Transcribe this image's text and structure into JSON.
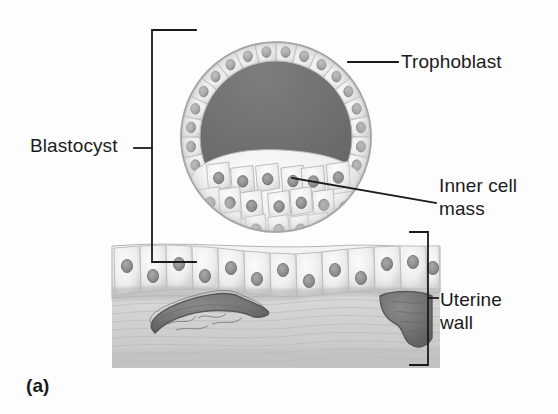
{
  "figure": {
    "panel_label": "(a)",
    "background_color": "#fdfdfd",
    "line_color": "#1b1b1b",
    "width": 558,
    "height": 414
  },
  "labels": {
    "blastocyst": "Blastocyst",
    "trophoblast": "Trophoblast",
    "inner_cell_mass_line1": "Inner cell",
    "inner_cell_mass_line2": "mass",
    "uterine_wall_line1": "Uterine",
    "uterine_wall_line2": "wall"
  },
  "structures": {
    "blastocyst": {
      "name": "blastocyst",
      "shape": "sphere",
      "center_x": 276,
      "center_y": 137,
      "radius": 96,
      "bracket": {
        "x": 152,
        "y_top": 30,
        "y_bottom": 262,
        "tick_y": 148
      }
    },
    "blastocoel": {
      "name": "blastocoel-cavity",
      "fill_color": "#6e6e6e",
      "description": "dark fluid-filled cavity"
    },
    "trophoblast": {
      "name": "trophoblast-cell-layer",
      "cell_count": 28,
      "fill_color": "#ececec",
      "leader": {
        "x1": 348,
        "y1": 62,
        "x2": 398,
        "y2": 62
      }
    },
    "inner_cell_mass": {
      "name": "inner-cell-mass",
      "cell_count": 34,
      "fill_color": "#f1f1f1",
      "leader": {
        "x1": 292,
        "y1": 178,
        "x2": 436,
        "y2": 203
      }
    },
    "uterine_wall": {
      "name": "uterine-wall",
      "left": 112,
      "right": 440,
      "top": 242,
      "bottom": 368,
      "epithelium_fill": "#e9e9e9",
      "stroma_fill": "#cfcfcf",
      "vessel_fill": "#767676",
      "vessel_count": 2,
      "bracket": {
        "x": 428,
        "y_top": 232,
        "y_bottom": 365,
        "tick_y": 298
      }
    }
  },
  "colors": {
    "ink": "#1b1b1b",
    "cavity": "#6e6e6e",
    "cell_light": "#f2f2f2",
    "cell_mid": "#dcdcdc",
    "nucleus": "#8a8a8a",
    "vessel": "#777777",
    "stroma": "#d2d2d2"
  }
}
